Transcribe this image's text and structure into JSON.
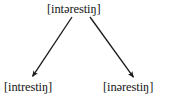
{
  "diagram": {
    "type": "phonological-derivation",
    "background_color": "#ffffff",
    "text_color": "#161616",
    "arrow_color": "#1c1c1c",
    "source": {
      "label": "[intərestiŋ]",
      "role": "underlying-form"
    },
    "variants": [
      {
        "label": "[intrestiŋ]",
        "role": "derived-form-left",
        "position": "bottom-left"
      },
      {
        "label": "[inərestiŋ]",
        "role": "derived-form-right",
        "position": "bottom-right"
      }
    ],
    "arrows": [
      {
        "name": "arrow-to-left-variant",
        "from": [
          72,
          17
        ],
        "to": [
          31,
          78
        ],
        "direction": "down-left"
      },
      {
        "name": "arrow-to-right-variant",
        "from": [
          90,
          17
        ],
        "to": [
          135,
          79
        ],
        "direction": "down-right"
      }
    ]
  }
}
